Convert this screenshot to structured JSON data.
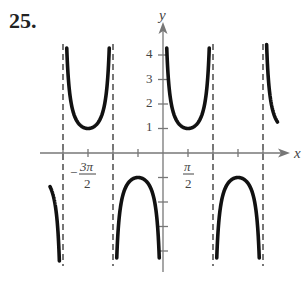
{
  "problem_number": "25.",
  "chart_data": {
    "type": "line",
    "title": "",
    "function": "y = csc(x)",
    "xlabel": "x",
    "ylabel": "y",
    "x_tick_labels": [
      {
        "value": "-3π/2",
        "numerator": "3π",
        "denominator": "2",
        "sign": "−"
      },
      {
        "value": "π/2",
        "numerator": "π",
        "denominator": "2",
        "sign": ""
      }
    ],
    "x_ticks": [
      "-2π",
      "-3π/2",
      "-π",
      "-π/2",
      "0",
      "π/2",
      "π",
      "3π/2",
      "2π"
    ],
    "y_tick_labels": [
      "1",
      "2",
      "3",
      "4"
    ],
    "y_ticks_negative": [
      -1,
      -2,
      -3,
      -4
    ],
    "asymptotes": [
      "-2π",
      "-π",
      "0",
      "π",
      "2π"
    ],
    "xlim": [
      "-2.2π",
      "2.3π"
    ],
    "ylim": [
      -4.5,
      4.5
    ],
    "series": [
      {
        "name": "csc(x)",
        "branches": [
          {
            "interval": "(-2.25π, -2π)",
            "direction": "down",
            "extremum": null
          },
          {
            "interval": "(-2π, -π)",
            "direction": "up",
            "extremum": {
              "x": "-3π/2",
              "y": 1
            }
          },
          {
            "interval": "(-π, 0)",
            "direction": "down",
            "extremum": {
              "x": "-π/2",
              "y": -1
            }
          },
          {
            "interval": "(0, π)",
            "direction": "up",
            "extremum": {
              "x": "π/2",
              "y": 1
            }
          },
          {
            "interval": "(π, 2π)",
            "direction": "down",
            "extremum": {
              "x": "3π/2",
              "y": -1
            }
          },
          {
            "interval": "(2π, 2.2π)",
            "direction": "up",
            "extremum": null
          }
        ]
      }
    ],
    "grid": false,
    "legend": null
  }
}
